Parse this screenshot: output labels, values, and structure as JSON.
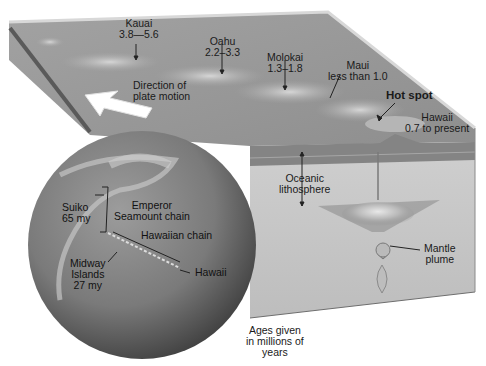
{
  "diagram": {
    "title_hidden": "Hawaiian hot spot and plate motion",
    "block": {
      "top_surface_color": "#9a9a9a",
      "side_color": "#c4c4c4",
      "lithosphere_color": "#7f7f7f"
    },
    "islands": [
      {
        "name": "Kauai",
        "age": "3.8—5.6"
      },
      {
        "name": "Oahu",
        "age": "2.2–3.3"
      },
      {
        "name": "Molokai",
        "age": "1.3–1.8"
      },
      {
        "name": "Maui",
        "age": "less than 1.0"
      },
      {
        "name": "Hawaii",
        "age": "0.7 to present"
      }
    ],
    "labels": {
      "plate_motion_line1": "Direction of",
      "plate_motion_line2": "plate motion",
      "hot_spot": "Hot spot",
      "oceanic_line1": "Oceanic",
      "oceanic_line2": "lithosphere",
      "mantle_line1": "Mantle",
      "mantle_line2": "plume",
      "ages_line1": "Ages given",
      "ages_line2": "in millions of",
      "ages_line3": "years"
    },
    "globe": {
      "suiko_line1": "Suiko",
      "suiko_line2": "65 my",
      "emperor_line1": "Emperor",
      "emperor_line2": "Seamount chain",
      "hawaiian_chain": "Hawaiian chain",
      "midway_line1": "Midway",
      "midway_line2": "Islands",
      "midway_line3": "27 my",
      "hawaii": "Hawaii"
    }
  }
}
